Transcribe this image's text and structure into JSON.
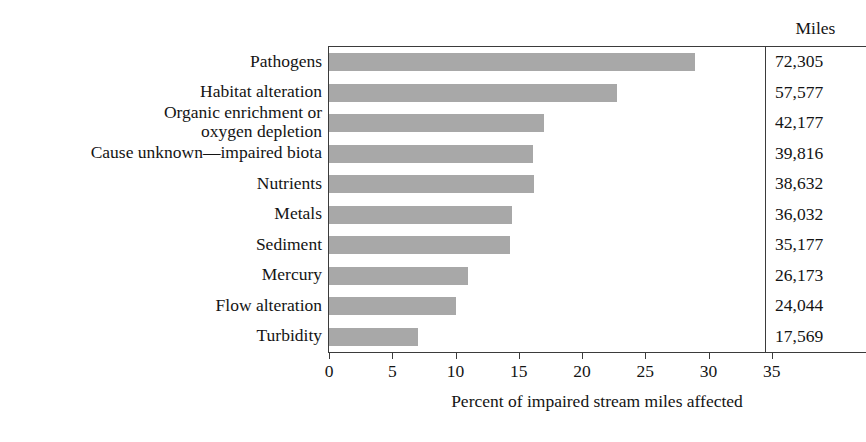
{
  "chart_data": {
    "type": "bar",
    "orientation": "horizontal",
    "title": "",
    "xlabel": "Percent of impaired stream miles affected",
    "ylabel": "",
    "xlim": [
      0,
      35
    ],
    "xticks": [
      0,
      5,
      10,
      15,
      20,
      25,
      30,
      35
    ],
    "xtick_labels": [
      "0",
      "5",
      "10",
      "15",
      "20",
      "25",
      "30",
      "35"
    ],
    "grid": false,
    "legend": null,
    "bar_color": "#a8a8a8",
    "axis_color": "#3b3b3b",
    "categories": [
      "Pathogens",
      "Habitat alteration",
      "Organic enrichment or\noxygen depletion",
      "Cause unknown—impaired biota",
      "Nutrients",
      "Metals",
      "Sediment",
      "Mercury",
      "Flow alteration",
      "Turbidity"
    ],
    "values": [
      28.9,
      22.8,
      17.0,
      16.1,
      16.2,
      14.5,
      14.3,
      11.0,
      10.0,
      7.0
    ],
    "secondary_column": {
      "header": "Miles",
      "values": [
        "72,305",
        "57,577",
        "42,177",
        "39,816",
        "38,632",
        "36,032",
        "35,177",
        "26,173",
        "24,044",
        "17,569"
      ]
    }
  }
}
